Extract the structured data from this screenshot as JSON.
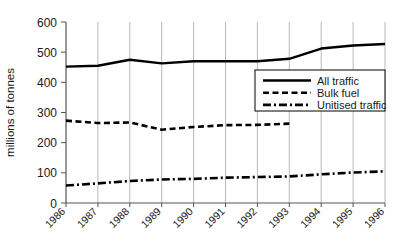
{
  "chart_data": {
    "type": "line",
    "title": "",
    "subtitle": "",
    "xlabel": "",
    "ylabel": "millions of tonnes",
    "x": [
      1986,
      1987,
      1988,
      1989,
      1990,
      1991,
      1992,
      1993,
      1994,
      1995,
      1996
    ],
    "categories": [
      "1986",
      "1987",
      "1988",
      "1989",
      "1990",
      "1991",
      "1992",
      "1993",
      "1994",
      "1995",
      "1996"
    ],
    "xlim": [
      1986,
      1996
    ],
    "ylim": [
      0,
      600
    ],
    "yticks": [
      0,
      100,
      200,
      300,
      400,
      500,
      600
    ],
    "ytick_labels": [
      "0",
      "100",
      "200",
      "300",
      "400",
      "500",
      "600"
    ],
    "grid": "vertical",
    "legend_position": "inside-right-upper",
    "series": [
      {
        "name": "All traffic",
        "style": "solid",
        "color": "#000000",
        "values": [
          452,
          455,
          475,
          463,
          470,
          470,
          470,
          478,
          512,
          522,
          527
        ]
      },
      {
        "name": "Bulk fuel",
        "style": "dashed",
        "color": "#000000",
        "values": [
          273,
          265,
          267,
          243,
          252,
          258,
          259,
          263,
          null,
          null,
          null
        ]
      },
      {
        "name": "Unitised traffic",
        "style": "dash-dot",
        "color": "#000000",
        "values": [
          58,
          65,
          73,
          78,
          80,
          84,
          86,
          88,
          95,
          101,
          105
        ]
      }
    ]
  },
  "legend": {
    "items": [
      {
        "label": "All traffic",
        "style": "solid"
      },
      {
        "label": "Bulk fuel",
        "style": "dashed"
      },
      {
        "label": "Unitised traffic",
        "style": "dash-dot"
      }
    ]
  },
  "axes": {
    "y_title": "millions of tonnes"
  },
  "colors": {
    "line": "#000000",
    "grid": "#b8b8b8",
    "axis": "#555555",
    "background": "#ffffff"
  }
}
